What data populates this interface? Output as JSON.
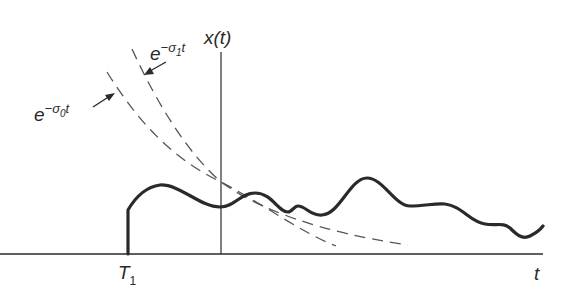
{
  "figure": {
    "type": "signal-envelope-diagram",
    "y_axis_label": "x(t)",
    "x_axis_label": "t",
    "step_label": {
      "main": "T",
      "sub": "1"
    },
    "envelopes": [
      {
        "id": "sigma0",
        "base": "e",
        "exp_prefix": "−σ",
        "exp_sub": "0",
        "exp_suffix": "t",
        "style": "dashed"
      },
      {
        "id": "sigma1",
        "base": "e",
        "exp_prefix": "−σ",
        "exp_sub": "1",
        "exp_suffix": "t",
        "style": "dashed"
      }
    ],
    "signal": {
      "style": "solid-thick",
      "description": "x(t) starting at T1, bounded by exponential envelopes"
    },
    "colors": {
      "ink": "#2a2a2a",
      "dash": "#555555",
      "background": "#ffffff"
    }
  }
}
